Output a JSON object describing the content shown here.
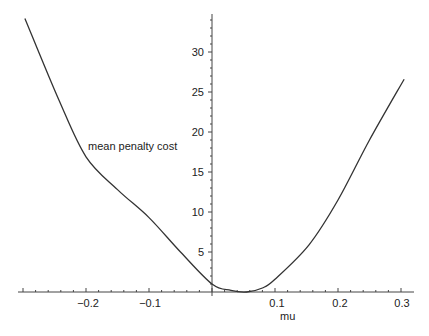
{
  "chart_data": {
    "type": "line",
    "title": "",
    "xlabel": "mu",
    "ylabel": "mean penalty cost",
    "xlim": [
      -0.3,
      0.31
    ],
    "ylim": [
      0,
      35
    ],
    "grid": false,
    "legend": null,
    "x_ticks": [
      -0.2,
      -0.1,
      0.1,
      0.2,
      0.3
    ],
    "x_tick_labels": [
      "−0.2",
      "−0.1",
      "0.1",
      "0.2",
      "0.3"
    ],
    "y_ticks": [
      5,
      10,
      15,
      20,
      25,
      30
    ],
    "y_tick_labels": [
      "5",
      "10",
      "15",
      "20",
      "25",
      "30"
    ],
    "series": [
      {
        "name": "mean penalty cost",
        "color": "#333333",
        "x": [
          -0.297,
          -0.243,
          -0.2,
          -0.15,
          -0.1,
          -0.05,
          0.0,
          0.03,
          0.055,
          0.08,
          0.1,
          0.154,
          0.2,
          0.25,
          0.305
        ],
        "y": [
          34.2,
          24.0,
          16.9,
          12.8,
          9.3,
          5.0,
          1.0,
          0.2,
          0.0,
          0.5,
          1.6,
          5.9,
          11.5,
          19.0,
          26.6
        ]
      }
    ]
  },
  "labels": {
    "ylabel": "mean penalty cost",
    "xlabel": "mu",
    "xticks": [
      "−0.2",
      "−0.1",
      "0.1",
      "0.2",
      "0.3"
    ],
    "yticks": [
      "5",
      "10",
      "15",
      "20",
      "25",
      "30"
    ]
  }
}
